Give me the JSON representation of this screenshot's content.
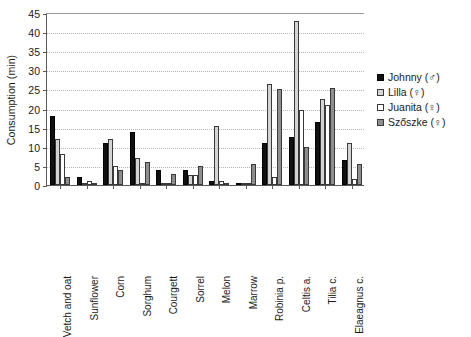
{
  "chart_data": {
    "type": "bar",
    "title": "",
    "xlabel": "",
    "ylabel": "Consumption (min)",
    "ylim": [
      0,
      45
    ],
    "yticks": [
      0,
      5,
      10,
      15,
      20,
      25,
      30,
      35,
      40,
      45
    ],
    "grid": true,
    "legend_position": "right",
    "categories": [
      "Vetch and oat",
      "Sunflower",
      "Corn",
      "Sorghum",
      "Courgett",
      "Sorrel",
      "Melon",
      "Marrow",
      "Robinia p.",
      "Celtis a.",
      "Tilia c.",
      "Elaeagnus c."
    ],
    "series": [
      {
        "name": "Johnny (♂)",
        "color": "#111111",
        "values": [
          18,
          2,
          11,
          14,
          4,
          4,
          1,
          0.3,
          11,
          12.5,
          16.5,
          6.5
        ]
      },
      {
        "name": "Lilla (♀)",
        "color": "#d4d4d4",
        "values": [
          12,
          0,
          12,
          7,
          0.5,
          2.5,
          15.5,
          0,
          26.5,
          43,
          22.5,
          11
        ]
      },
      {
        "name": "Juanita (♀)",
        "color": "#ffffff",
        "values": [
          8,
          1,
          5,
          0,
          0,
          2.5,
          1,
          0,
          2,
          19.5,
          21,
          1.5
        ]
      },
      {
        "name": "Szőszke (♀)",
        "color": "#8e8e8e",
        "values": [
          2,
          0,
          4,
          6,
          3,
          5,
          0.2,
          5.5,
          25,
          10,
          25.5,
          5.5
        ]
      }
    ]
  },
  "axis": {
    "y_title": "Consumption (min)",
    "y_tick_labels": [
      "0",
      "5",
      "10",
      "15",
      "20",
      "25",
      "30",
      "35",
      "40",
      "45"
    ]
  },
  "legend": {
    "items": [
      {
        "label": "Johnny (♂)",
        "swatch": "black-square-icon"
      },
      {
        "label": "Lilla (♀)",
        "swatch": "light-gray-square-icon"
      },
      {
        "label": "Juanita (♀)",
        "swatch": "white-square-icon"
      },
      {
        "label": "Szőszke (♀)",
        "swatch": "gray-square-icon"
      }
    ]
  }
}
